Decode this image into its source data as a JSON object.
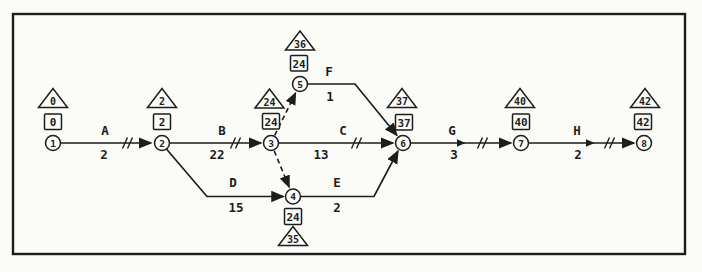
{
  "figure": {
    "kind": "CPM activity-on-arrow network diagram",
    "line_color": "#1d1d1d",
    "background_color": "#fbfbf8",
    "legend": {
      "circle": "event node number",
      "square": "earliest event time",
      "triangle": "latest event time",
      "double_slash": "critical path tick",
      "dashed_arrow": "dummy activity"
    }
  },
  "nodes": [
    {
      "id": "1",
      "early": "0",
      "late": "0"
    },
    {
      "id": "2",
      "early": "2",
      "late": "2"
    },
    {
      "id": "3",
      "early": "24",
      "late": "24"
    },
    {
      "id": "4",
      "early": "24",
      "late": "35"
    },
    {
      "id": "5",
      "early": "24",
      "late": "36"
    },
    {
      "id": "6",
      "early": "37",
      "late": "37"
    },
    {
      "id": "7",
      "early": "40",
      "late": "40"
    },
    {
      "id": "8",
      "early": "42",
      "late": "42"
    }
  ],
  "activities": [
    {
      "name": "A",
      "duration": "2",
      "from": "1",
      "to": "2",
      "critical": true
    },
    {
      "name": "B",
      "duration": "22",
      "from": "2",
      "to": "3",
      "critical": true
    },
    {
      "name": "C",
      "duration": "13",
      "from": "3",
      "to": "6",
      "critical": true
    },
    {
      "name": "D",
      "duration": "15",
      "from": "2",
      "to": "4",
      "critical": false
    },
    {
      "name": "E",
      "duration": "2",
      "from": "4",
      "to": "6",
      "critical": false
    },
    {
      "name": "F",
      "duration": "1",
      "from": "5",
      "to": "6",
      "critical": false
    },
    {
      "name": "G",
      "duration": "3",
      "from": "6",
      "to": "7",
      "critical": true
    },
    {
      "name": "H",
      "duration": "2",
      "from": "7",
      "to": "8",
      "critical": true
    }
  ],
  "dummy_activities": [
    {
      "from": "3",
      "to": "5"
    },
    {
      "from": "3",
      "to": "4"
    }
  ]
}
